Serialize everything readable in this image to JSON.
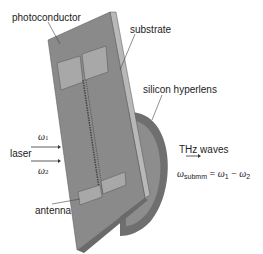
{
  "labels": {
    "photoconductor": "photoconductor",
    "substrate": "substrate",
    "silicon_hyperlens": "silicon hyperlens",
    "laser": "laser",
    "antenna": "antenna",
    "thz_waves": "THz waves",
    "omega1": "ω",
    "omega1_sub": "1",
    "omega2": "ω",
    "omega2_sub": "2"
  },
  "equation": {
    "lhs": "ω",
    "lhs_sub": "submm",
    "eq": " = ",
    "w1": "ω",
    "w1_sub": "1",
    "minus": " − ",
    "w2": "ω",
    "w2_sub": "2"
  },
  "colors": {
    "plate_face": "#8a8a8a",
    "plate_edge": "#b5b5b5",
    "lens": "#6f6f6f",
    "lens_inner": "#9a9a9a",
    "pads": "#a8a8a8",
    "text": "#222222"
  }
}
